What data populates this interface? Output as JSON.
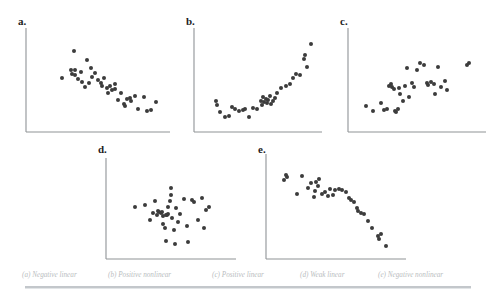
{
  "figure": {
    "title": "",
    "background_color": "#ffffff",
    "dot_color": "#3c3c3c",
    "axis_color": "#8f9396",
    "caption_color": "#b9bdc0"
  },
  "panels": [
    {
      "id": "a",
      "label": "a.",
      "caption": "(a) Negative linear",
      "relationship": "Negative linear"
    },
    {
      "id": "b",
      "label": "b.",
      "caption": "(b) Positive nonlinear",
      "relationship": "Positive nonlinear"
    },
    {
      "id": "c",
      "label": "c.",
      "caption": "(c) Positive linear",
      "relationship": "Positive linear"
    },
    {
      "id": "d",
      "label": "d.",
      "caption": "(d) Weak linear",
      "relationship": "Weak linear"
    },
    {
      "id": "e",
      "label": "e.",
      "caption": "(e) Negative nonlinear",
      "relationship": "Negative nonlinear"
    }
  ],
  "caption_items": [
    {
      "text": "(a) Negative linear",
      "x": 22
    },
    {
      "text": "(b) Positive nonlinear",
      "x": 108
    },
    {
      "text": "(c) Positive linear",
      "x": 212
    },
    {
      "text": "(d) Weak linear",
      "x": 300
    },
    {
      "text": "(e) Negative nonlinear",
      "x": 378
    }
  ],
  "chart_data": [
    {
      "type": "scatter",
      "id": "a",
      "title": "a.",
      "annotation": "(a) Negative linear",
      "xlabel": "",
      "ylabel": "",
      "grid": false,
      "legend": "none",
      "xlim": [
        0,
        100
      ],
      "ylim": [
        0,
        100
      ],
      "points": [
        [
          33,
          78
        ],
        [
          25,
          52
        ],
        [
          42,
          69
        ],
        [
          31,
          60
        ],
        [
          34,
          60
        ],
        [
          34,
          55
        ],
        [
          32,
          56
        ],
        [
          36,
          51
        ],
        [
          39,
          48
        ],
        [
          41,
          43
        ],
        [
          45,
          62
        ],
        [
          48,
          57
        ],
        [
          50,
          50
        ],
        [
          52,
          47
        ],
        [
          53,
          44
        ],
        [
          54,
          52
        ],
        [
          56,
          42
        ],
        [
          58,
          44
        ],
        [
          60,
          40
        ],
        [
          62,
          41
        ],
        [
          62,
          46
        ],
        [
          64,
          31
        ],
        [
          66,
          38
        ],
        [
          68,
          27
        ],
        [
          70,
          32
        ],
        [
          72,
          33
        ],
        [
          73,
          30
        ],
        [
          76,
          35
        ],
        [
          78,
          22
        ],
        [
          82,
          34
        ],
        [
          84,
          20
        ],
        [
          87,
          21
        ],
        [
          90,
          29
        ],
        [
          46,
          53
        ],
        [
          38,
          58
        ],
        [
          44,
          47
        ],
        [
          57,
          38
        ],
        [
          69,
          25
        ]
      ]
    },
    {
      "type": "scatter",
      "id": "b",
      "title": "b.",
      "annotation": "(b) Positive nonlinear",
      "xlabel": "",
      "ylabel": "",
      "grid": false,
      "legend": "none",
      "xlim": [
        0,
        100
      ],
      "ylim": [
        0,
        100
      ],
      "points": [
        [
          17,
          30
        ],
        [
          18,
          26
        ],
        [
          20,
          19
        ],
        [
          24,
          14
        ],
        [
          27,
          15
        ],
        [
          30,
          24
        ],
        [
          32,
          22
        ],
        [
          35,
          20
        ],
        [
          38,
          21
        ],
        [
          40,
          22
        ],
        [
          43,
          14
        ],
        [
          46,
          23
        ],
        [
          49,
          22
        ],
        [
          52,
          30
        ],
        [
          54,
          34
        ],
        [
          55,
          29
        ],
        [
          56,
          32
        ],
        [
          57,
          28
        ],
        [
          58,
          31
        ],
        [
          60,
          27
        ],
        [
          62,
          30
        ],
        [
          65,
          38
        ],
        [
          68,
          42
        ],
        [
          72,
          44
        ],
        [
          75,
          46
        ],
        [
          77,
          52
        ],
        [
          80,
          56
        ],
        [
          83,
          55
        ],
        [
          86,
          70
        ],
        [
          87,
          74
        ],
        [
          88,
          63
        ],
        [
          91,
          85
        ],
        [
          53,
          26
        ],
        [
          59,
          35
        ],
        [
          63,
          33
        ]
      ]
    },
    {
      "type": "scatter",
      "id": "c",
      "title": "c.",
      "annotation": "(c) Positive linear",
      "xlabel": "",
      "ylabel": "",
      "grid": false,
      "legend": "none",
      "xlim": [
        0,
        100
      ],
      "ylim": [
        0,
        100
      ],
      "points": [
        [
          13,
          25
        ],
        [
          18,
          20
        ],
        [
          24,
          28
        ],
        [
          26,
          21
        ],
        [
          28,
          22
        ],
        [
          30,
          44
        ],
        [
          31,
          46
        ],
        [
          32,
          43
        ],
        [
          33,
          41
        ],
        [
          34,
          20
        ],
        [
          35,
          19
        ],
        [
          36,
          22
        ],
        [
          38,
          37
        ],
        [
          40,
          30
        ],
        [
          43,
          62
        ],
        [
          44,
          34
        ],
        [
          46,
          47
        ],
        [
          48,
          43
        ],
        [
          50,
          60
        ],
        [
          52,
          66
        ],
        [
          55,
          64
        ],
        [
          57,
          47
        ],
        [
          58,
          45
        ],
        [
          60,
          48
        ],
        [
          62,
          46
        ],
        [
          63,
          37
        ],
        [
          65,
          63
        ],
        [
          67,
          43
        ],
        [
          70,
          49
        ],
        [
          72,
          40
        ],
        [
          86,
          64
        ],
        [
          88,
          66
        ],
        [
          41,
          44
        ],
        [
          37,
          42
        ]
      ]
    },
    {
      "type": "scatter",
      "id": "d",
      "title": "d.",
      "annotation": "(d) Weak linear",
      "xlabel": "",
      "ylabel": "",
      "grid": false,
      "legend": "none",
      "xlim": [
        0,
        100
      ],
      "ylim": [
        0,
        100
      ],
      "points": [
        [
          22,
          52
        ],
        [
          30,
          54
        ],
        [
          34,
          39
        ],
        [
          36,
          46
        ],
        [
          38,
          57
        ],
        [
          39,
          44
        ],
        [
          40,
          48
        ],
        [
          41,
          47
        ],
        [
          42,
          46
        ],
        [
          43,
          47
        ],
        [
          44,
          35
        ],
        [
          45,
          31
        ],
        [
          46,
          18
        ],
        [
          47,
          44
        ],
        [
          48,
          52
        ],
        [
          49,
          57
        ],
        [
          50,
          70
        ],
        [
          50,
          63
        ],
        [
          51,
          41
        ],
        [
          52,
          29
        ],
        [
          53,
          15
        ],
        [
          54,
          51
        ],
        [
          55,
          37
        ],
        [
          57,
          45
        ],
        [
          60,
          59
        ],
        [
          62,
          33
        ],
        [
          63,
          17
        ],
        [
          66,
          58
        ],
        [
          68,
          56
        ],
        [
          71,
          39
        ],
        [
          74,
          60
        ],
        [
          75,
          31
        ],
        [
          77,
          49
        ],
        [
          79,
          52
        ],
        [
          44,
          43
        ],
        [
          46,
          44
        ],
        [
          48,
          45
        ]
      ]
    },
    {
      "type": "scatter",
      "id": "e",
      "title": "e.",
      "annotation": "(e) Negative nonlinear",
      "xlabel": "",
      "ylabel": "",
      "grid": false,
      "legend": "none",
      "xlim": [
        0,
        100
      ],
      "ylim": [
        0,
        100
      ],
      "points": [
        [
          13,
          75
        ],
        [
          14,
          80
        ],
        [
          15,
          78
        ],
        [
          22,
          62
        ],
        [
          26,
          79
        ],
        [
          30,
          68
        ],
        [
          32,
          72
        ],
        [
          34,
          59
        ],
        [
          36,
          73
        ],
        [
          37,
          70
        ],
        [
          38,
          76
        ],
        [
          40,
          62
        ],
        [
          42,
          64
        ],
        [
          44,
          60
        ],
        [
          46,
          67
        ],
        [
          49,
          66
        ],
        [
          52,
          67
        ],
        [
          54,
          66
        ],
        [
          57,
          64
        ],
        [
          59,
          58
        ],
        [
          61,
          56
        ],
        [
          63,
          54
        ],
        [
          65,
          49
        ],
        [
          66,
          46
        ],
        [
          68,
          44
        ],
        [
          70,
          43
        ],
        [
          73,
          36
        ],
        [
          76,
          30
        ],
        [
          80,
          22
        ],
        [
          81,
          19
        ],
        [
          82,
          24
        ],
        [
          86,
          12
        ],
        [
          35,
          65
        ],
        [
          48,
          61
        ]
      ]
    }
  ]
}
